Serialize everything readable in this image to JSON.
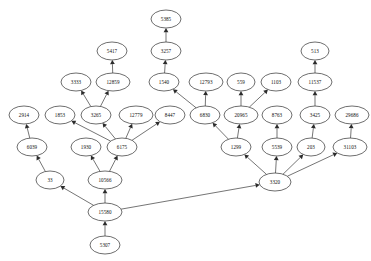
{
  "diagram": {
    "type": "directed-graph",
    "style": {
      "node_shape": "ellipse",
      "node_fill": "#ffffff",
      "node_stroke": "#2f2f2f",
      "edge_color": "#3a3a3a",
      "arrow_color": "#2b2b2b",
      "background": "#ffffff",
      "flow_direction": "bottom-to-top"
    },
    "nodes": [
      {
        "id": "5385",
        "label": "5385",
        "x": 166,
        "y": 19,
        "rx": 15,
        "ry": 9
      },
      {
        "id": "3257",
        "label": "3257",
        "x": 166,
        "y": 51,
        "rx": 15,
        "ry": 9
      },
      {
        "id": "5417",
        "label": "5417",
        "x": 112,
        "y": 51,
        "rx": 15,
        "ry": 9
      },
      {
        "id": "513",
        "label": "513",
        "x": 315,
        "y": 51,
        "rx": 14,
        "ry": 9
      },
      {
        "id": "3333",
        "label": "3333",
        "x": 76,
        "y": 82,
        "rx": 15,
        "ry": 9
      },
      {
        "id": "12859",
        "label": "12859",
        "x": 113,
        "y": 82,
        "rx": 17,
        "ry": 9
      },
      {
        "id": "1540",
        "label": "1540",
        "x": 164,
        "y": 82,
        "rx": 15,
        "ry": 9
      },
      {
        "id": "12793",
        "label": "12793",
        "x": 206,
        "y": 82,
        "rx": 17,
        "ry": 9
      },
      {
        "id": "559",
        "label": "559",
        "x": 241,
        "y": 82,
        "rx": 14,
        "ry": 9
      },
      {
        "id": "1103",
        "label": "1103",
        "x": 276,
        "y": 82,
        "rx": 15,
        "ry": 9
      },
      {
        "id": "11537",
        "label": "11537",
        "x": 315,
        "y": 82,
        "rx": 17,
        "ry": 9
      },
      {
        "id": "2914",
        "label": "2914",
        "x": 24,
        "y": 115,
        "rx": 15,
        "ry": 9
      },
      {
        "id": "1853",
        "label": "1853",
        "x": 60,
        "y": 115,
        "rx": 15,
        "ry": 9
      },
      {
        "id": "3265",
        "label": "3265",
        "x": 96,
        "y": 115,
        "rx": 15,
        "ry": 9
      },
      {
        "id": "12779",
        "label": "12779",
        "x": 136,
        "y": 115,
        "rx": 17,
        "ry": 9
      },
      {
        "id": "8447",
        "label": "8447",
        "x": 170,
        "y": 115,
        "rx": 15,
        "ry": 9
      },
      {
        "id": "6830",
        "label": "6830",
        "x": 205,
        "y": 115,
        "rx": 15,
        "ry": 9
      },
      {
        "id": "20965",
        "label": "20965",
        "x": 241,
        "y": 115,
        "rx": 17,
        "ry": 9
      },
      {
        "id": "8763",
        "label": "8763",
        "x": 277,
        "y": 115,
        "rx": 15,
        "ry": 9
      },
      {
        "id": "3425",
        "label": "3425",
        "x": 315,
        "y": 115,
        "rx": 15,
        "ry": 9
      },
      {
        "id": "29686",
        "label": "29686",
        "x": 352,
        "y": 115,
        "rx": 17,
        "ry": 9
      },
      {
        "id": "6039",
        "label": "6039",
        "x": 32,
        "y": 147,
        "rx": 15,
        "ry": 9
      },
      {
        "id": "1930",
        "label": "1930",
        "x": 86,
        "y": 147,
        "rx": 15,
        "ry": 9
      },
      {
        "id": "6175",
        "label": "6175",
        "x": 122,
        "y": 147,
        "rx": 15,
        "ry": 9
      },
      {
        "id": "1299",
        "label": "1299",
        "x": 236,
        "y": 147,
        "rx": 15,
        "ry": 9
      },
      {
        "id": "5539",
        "label": "5539",
        "x": 277,
        "y": 147,
        "rx": 15,
        "ry": 9
      },
      {
        "id": "203",
        "label": "203",
        "x": 311,
        "y": 147,
        "rx": 14,
        "ry": 9
      },
      {
        "id": "31103",
        "label": "31103",
        "x": 350,
        "y": 147,
        "rx": 17,
        "ry": 9
      },
      {
        "id": "33",
        "label": "33",
        "x": 50,
        "y": 180,
        "rx": 14,
        "ry": 9
      },
      {
        "id": "10566",
        "label": "10566",
        "x": 105,
        "y": 180,
        "rx": 17,
        "ry": 9
      },
      {
        "id": "3320",
        "label": "3320",
        "x": 275,
        "y": 182,
        "rx": 16,
        "ry": 9
      },
      {
        "id": "15580",
        "label": "15580",
        "x": 105,
        "y": 212,
        "rx": 17,
        "ry": 9
      },
      {
        "id": "5307",
        "label": "5307",
        "x": 105,
        "y": 245,
        "rx": 15,
        "ry": 9
      }
    ],
    "edges": [
      {
        "from": "3257",
        "to": "5385"
      },
      {
        "from": "1540",
        "to": "3257"
      },
      {
        "from": "12859",
        "to": "5417"
      },
      {
        "from": "3265",
        "to": "3333"
      },
      {
        "from": "3265",
        "to": "12859"
      },
      {
        "from": "6830",
        "to": "1540"
      },
      {
        "from": "6830",
        "to": "12793"
      },
      {
        "from": "20965",
        "to": "559"
      },
      {
        "from": "20965",
        "to": "1103"
      },
      {
        "from": "11537",
        "to": "513"
      },
      {
        "from": "3425",
        "to": "11537"
      },
      {
        "from": "203",
        "to": "3425"
      },
      {
        "from": "31103",
        "to": "29686"
      },
      {
        "from": "6039",
        "to": "2914"
      },
      {
        "from": "6175",
        "to": "1853"
      },
      {
        "from": "6175",
        "to": "3265"
      },
      {
        "from": "6175",
        "to": "12779"
      },
      {
        "from": "6175",
        "to": "8447"
      },
      {
        "from": "1299",
        "to": "6830"
      },
      {
        "from": "1299",
        "to": "20965"
      },
      {
        "from": "5539",
        "to": "8763"
      },
      {
        "from": "33",
        "to": "6039"
      },
      {
        "from": "10566",
        "to": "1930"
      },
      {
        "from": "10566",
        "to": "6175"
      },
      {
        "from": "3320",
        "to": "1299"
      },
      {
        "from": "3320",
        "to": "5539"
      },
      {
        "from": "3320",
        "to": "203"
      },
      {
        "from": "3320",
        "to": "31103"
      },
      {
        "from": "15580",
        "to": "33"
      },
      {
        "from": "15580",
        "to": "10566"
      },
      {
        "from": "15580",
        "to": "3320"
      },
      {
        "from": "5307",
        "to": "15580"
      }
    ]
  }
}
